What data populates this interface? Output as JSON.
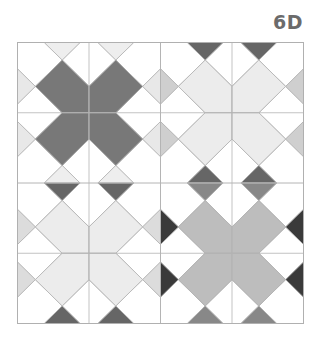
{
  "label": "6D",
  "grid": {
    "x": 17,
    "y": 42,
    "width": 286,
    "height": 281,
    "cell_count": 4,
    "line_color": "#b4b4b4",
    "border_color": "#b0b0b0",
    "quadrants": [
      {
        "name": "top-left",
        "col": 0,
        "row": 0,
        "x_fill": "#787878",
        "top_bottom_fill": "#eeeeee",
        "side_fill": "#e8e8e8"
      },
      {
        "name": "top-right",
        "col": 1,
        "row": 0,
        "x_fill": "#ececec",
        "top_bottom_fill": "#666666",
        "side_fill": "#cfcfcf"
      },
      {
        "name": "bottom-left",
        "col": 0,
        "row": 1,
        "x_fill": "#ececec",
        "top_bottom_fill": "#666666",
        "side_fill": "#dcdcdc"
      },
      {
        "name": "bottom-right",
        "col": 1,
        "row": 1,
        "x_fill": "#bdbdbd",
        "top_bottom_fill": "#888888",
        "side_fill": "#3a3a3a"
      }
    ]
  }
}
